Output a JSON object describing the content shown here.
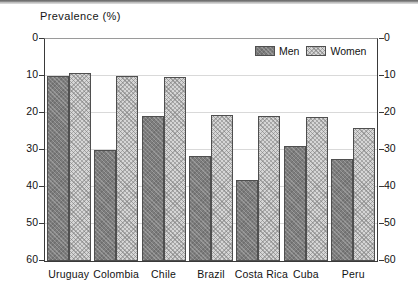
{
  "chart_data": {
    "type": "bar",
    "title": "Prevalence (%)",
    "xlabel": "",
    "ylabel": "Prevalence (%)",
    "ylim": [
      0,
      60
    ],
    "yticks": [
      0,
      10,
      20,
      30,
      40,
      50,
      60
    ],
    "grid": true,
    "mirrored_y_axis": true,
    "legend_position": "top-right",
    "categories": [
      "Uruguay",
      "Colombia",
      "Chile",
      "Brazil",
      "Costa Rica",
      "Cuba",
      "Peru"
    ],
    "series": [
      {
        "name": "Men",
        "color": "#7d7d7d",
        "pattern": "solid-gray",
        "values": [
          50.0,
          30.0,
          39.3,
          28.5,
          21.8,
          31.0,
          27.5
        ]
      },
      {
        "name": "Women",
        "color": "#d6d6d6",
        "pattern": "hatched-light",
        "values": [
          50.8,
          50.0,
          49.6,
          39.5,
          39.3,
          38.8,
          36.0
        ]
      }
    ]
  },
  "axis": {
    "left_ticks": [
      "60",
      "50",
      "40",
      "30",
      "20",
      "10",
      "0"
    ],
    "right_ticks": [
      "60",
      "50",
      "40",
      "30",
      "20",
      "10",
      "0"
    ]
  },
  "legend": {
    "items": [
      {
        "label": "Men"
      },
      {
        "label": "Women"
      }
    ]
  }
}
